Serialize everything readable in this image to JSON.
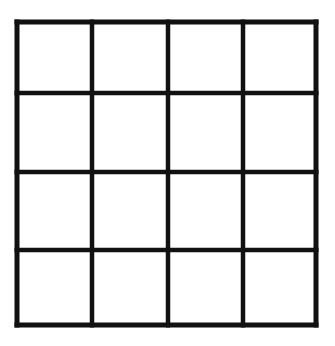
{
  "figure": {
    "name": "four-by-four-grid",
    "background_color": "#ffffff",
    "line_color": "#111111",
    "cell_fill_color": "#ffffff",
    "rows": 4,
    "columns": 4,
    "cell_count": 16,
    "canvas": {
      "width": 335,
      "height": 346
    },
    "bounds": {
      "left": 15,
      "top": 20,
      "right": 318,
      "bottom": 327
    },
    "stroke_widths": {
      "outer_border": 5,
      "inner_line": 4.5
    },
    "vertical_line_positions": [
      17,
      92,
      168,
      243,
      316
    ],
    "horizontal_line_positions": [
      22,
      93,
      172,
      250,
      325
    ],
    "cells": [
      {
        "id": "r1c1",
        "row": 1,
        "column": 1,
        "label": ""
      },
      {
        "id": "r1c2",
        "row": 1,
        "column": 2,
        "label": ""
      },
      {
        "id": "r1c3",
        "row": 1,
        "column": 3,
        "label": ""
      },
      {
        "id": "r1c4",
        "row": 1,
        "column": 4,
        "label": ""
      },
      {
        "id": "r2c1",
        "row": 2,
        "column": 1,
        "label": ""
      },
      {
        "id": "r2c2",
        "row": 2,
        "column": 2,
        "label": ""
      },
      {
        "id": "r2c3",
        "row": 2,
        "column": 3,
        "label": ""
      },
      {
        "id": "r2c4",
        "row": 2,
        "column": 4,
        "label": ""
      },
      {
        "id": "r3c1",
        "row": 3,
        "column": 1,
        "label": ""
      },
      {
        "id": "r3c2",
        "row": 3,
        "column": 2,
        "label": ""
      },
      {
        "id": "r3c3",
        "row": 3,
        "column": 3,
        "label": ""
      },
      {
        "id": "r3c4",
        "row": 3,
        "column": 4,
        "label": ""
      },
      {
        "id": "r4c1",
        "row": 4,
        "column": 1,
        "label": ""
      },
      {
        "id": "r4c2",
        "row": 4,
        "column": 2,
        "label": ""
      },
      {
        "id": "r4c3",
        "row": 4,
        "column": 3,
        "label": ""
      },
      {
        "id": "r4c4",
        "row": 4,
        "column": 4,
        "label": ""
      }
    ]
  }
}
